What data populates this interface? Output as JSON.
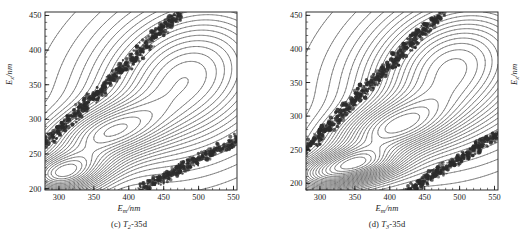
{
  "figure": {
    "panel_count": 2,
    "background_color": "#ffffff",
    "line_color": "#404040",
    "scatter_band_color": "#2b2b2b"
  },
  "panels": [
    {
      "id": "panel-c",
      "caption_index": "(c)",
      "caption_sample": "T",
      "caption_sub": "2",
      "caption_suffix": "-35d",
      "caption_full": "(c) T2-35d",
      "xlabel_main": "E",
      "xlabel_sub": "m",
      "xlabel_unit": "/nm",
      "ylabel_main": "E",
      "ylabel_sub": "x",
      "ylabel_unit": "/nm"
    },
    {
      "id": "panel-d",
      "caption_index": "(d)",
      "caption_sample": "T",
      "caption_sub": "3",
      "caption_suffix": "-35d",
      "caption_full": "(d) T3-35d",
      "xlabel_main": "E",
      "xlabel_sub": "m",
      "xlabel_unit": "/nm",
      "ylabel_main": "E",
      "ylabel_sub": "x",
      "ylabel_unit": "/nm"
    }
  ],
  "chart_data": [
    {
      "type": "heatmap",
      "subtype": "contour",
      "title": "(c) T2-35d",
      "xlabel": "Em/nm",
      "ylabel": "Ex/nm",
      "xlim": [
        280,
        555
      ],
      "ylim": [
        198,
        455
      ],
      "xticks": [
        300,
        350,
        400,
        450,
        500,
        550
      ],
      "yticks": [
        200,
        250,
        300,
        350,
        400,
        450
      ],
      "xminor_step": 10,
      "yminor_step": 10,
      "grid": false,
      "legend": "none",
      "contour_levels": 22,
      "annotations": [
        "Primary Rayleigh scatter band: diagonal dense band from (280,265) to (470,450)",
        "Second-order Rayleigh band: diagonal dense band from (420,200) to (555,270)",
        "Peak A (humic-like): centered near Em=365 nm, Ex=278 nm",
        "Peak B (protein-like / tyrosine): centered near Em=310 nm, Ex=228 nm",
        "Broad fulvic ridge extending to Em=520 nm, Ex=330-400 nm"
      ],
      "peaks": [
        {
          "name": "A",
          "em": 365,
          "ex": 278,
          "relative_intensity": 1.0
        },
        {
          "name": "B",
          "em": 312,
          "ex": 228,
          "relative_intensity": 0.85
        },
        {
          "name": "C",
          "em": 470,
          "ex": 360,
          "relative_intensity": 0.45
        }
      ]
    },
    {
      "type": "heatmap",
      "subtype": "contour",
      "title": "(d) T3-35d",
      "xlabel": "Em/nm",
      "ylabel": "Ex/nm",
      "xlim": [
        280,
        555
      ],
      "ylim": [
        190,
        455
      ],
      "xticks": [
        300,
        350,
        400,
        450,
        500,
        550
      ],
      "yticks": [
        200,
        250,
        300,
        350,
        400,
        450
      ],
      "xminor_step": 10,
      "yminor_step": 10,
      "grid": false,
      "legend": "none",
      "contour_levels": 24,
      "annotations": [
        "Primary Rayleigh scatter band: diagonal dense band from (280,250) to (470,450)",
        "Second-order Rayleigh band: diagonal dense band from (430,190) to (555,272)",
        "Peak A (humic-like): centered near Em=400 nm, Ex=280 nm",
        "Peak B (protein-like / tyrosine): centered near Em=350 nm, Ex=228 nm",
        "Broad fulvic ridge extending to Em=530 nm, Ex=330-410 nm"
      ],
      "peaks": [
        {
          "name": "A",
          "em": 400,
          "ex": 280,
          "relative_intensity": 0.95
        },
        {
          "name": "B",
          "em": 350,
          "ex": 228,
          "relative_intensity": 1.0
        },
        {
          "name": "C",
          "em": 480,
          "ex": 370,
          "relative_intensity": 0.5
        }
      ]
    }
  ],
  "axes": {
    "xtick_labels": [
      "300",
      "350",
      "400",
      "450",
      "500",
      "550"
    ],
    "ytick_labels": [
      "200",
      "250",
      "300",
      "350",
      "400",
      "450"
    ]
  }
}
